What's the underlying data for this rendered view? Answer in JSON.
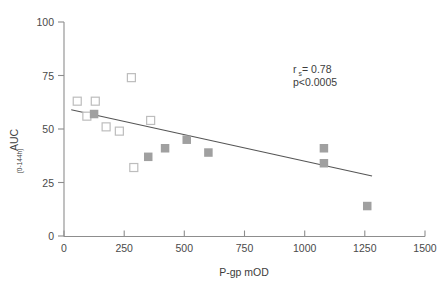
{
  "chart_data": {
    "type": "scatter",
    "title": "",
    "xlabel": "P-gp mOD",
    "ylabel": "AUC",
    "ylabel_subscript": "(0-144h)",
    "xlim": [
      0,
      1500
    ],
    "ylim": [
      0,
      100
    ],
    "xticks": [
      0,
      250,
      500,
      750,
      1000,
      1250,
      1500
    ],
    "xtick_labels": [
      "0",
      "250",
      "500",
      "750",
      "1000",
      "1250",
      "1500"
    ],
    "yticks": [
      0,
      25,
      50,
      75,
      100
    ],
    "ytick_labels": [
      "0",
      "25",
      "50",
      "75",
      "100"
    ],
    "grid": false,
    "legend": "none",
    "series": [
      {
        "name": "open-squares",
        "marker": "open square",
        "color": "#ffffff",
        "edge_color": "#bdbdbd",
        "points": [
          {
            "x": 55,
            "y": 63
          },
          {
            "x": 130,
            "y": 63
          },
          {
            "x": 95,
            "y": 56
          },
          {
            "x": 175,
            "y": 51
          },
          {
            "x": 230,
            "y": 49
          },
          {
            "x": 280,
            "y": 74
          },
          {
            "x": 290,
            "y": 32
          },
          {
            "x": 360,
            "y": 54
          }
        ]
      },
      {
        "name": "filled-squares",
        "marker": "filled square",
        "color": "#a0a0a0",
        "points": [
          {
            "x": 125,
            "y": 57
          },
          {
            "x": 350,
            "y": 37
          },
          {
            "x": 420,
            "y": 41
          },
          {
            "x": 510,
            "y": 45
          },
          {
            "x": 600,
            "y": 39
          },
          {
            "x": 1080,
            "y": 41
          },
          {
            "x": 1080,
            "y": 34
          },
          {
            "x": 1260,
            "y": 14
          }
        ]
      }
    ],
    "fit_line": {
      "name": "regression-line",
      "x_start": 30,
      "y_start": 59,
      "x_end": 1280,
      "y_end": 28,
      "color": "#555555"
    },
    "annotations": [
      {
        "name": "correlation",
        "label": "r",
        "subscript": "s",
        "value": " = 0.78",
        "x": 293,
        "y": 73
      },
      {
        "name": "pvalue",
        "text": "p<0.0005",
        "x": 293,
        "y": 86
      }
    ]
  }
}
